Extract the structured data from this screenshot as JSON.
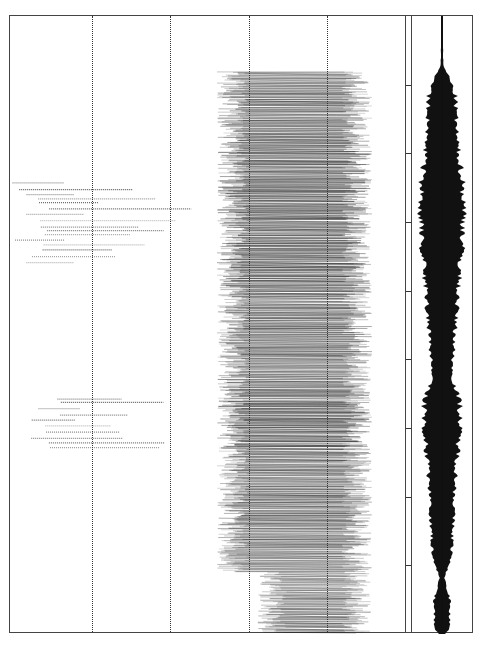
{
  "chart_data": {
    "type": "heatmap",
    "title": "",
    "subtitle": "",
    "xlabel": "",
    "ylabel": "",
    "grid": true,
    "gridlines_x_px": [
      91,
      169,
      248,
      326
    ],
    "panels": [
      {
        "name": "spectrogram",
        "bbox": [
          9,
          15,
          409,
          633
        ]
      },
      {
        "name": "waveform",
        "bbox": [
          411,
          15,
          473,
          633
        ]
      }
    ],
    "dense_band": {
      "x_start_frac": 0.53,
      "x_end_frac": 0.93,
      "y_start_frac": 0.09,
      "y_end_frac": 1.0
    },
    "sparse_harmonic_regions": [
      {
        "y_start_frac": 0.27,
        "y_end_frac": 0.4,
        "x_start_frac": 0.0,
        "x_end_frac": 0.45
      },
      {
        "y_start_frac": 0.62,
        "y_end_frac": 0.7,
        "x_start_frac": 0.03,
        "x_end_frac": 0.35
      }
    ],
    "waveform_envelope": [
      {
        "t": 0.0,
        "amp": 0.02
      },
      {
        "t": 0.08,
        "amp": 0.05
      },
      {
        "t": 0.1,
        "amp": 0.3
      },
      {
        "t": 0.13,
        "amp": 0.55
      },
      {
        "t": 0.2,
        "amp": 0.6
      },
      {
        "t": 0.27,
        "amp": 0.85
      },
      {
        "t": 0.33,
        "amp": 0.9
      },
      {
        "t": 0.4,
        "amp": 0.75
      },
      {
        "t": 0.5,
        "amp": 0.55
      },
      {
        "t": 0.58,
        "amp": 0.4
      },
      {
        "t": 0.63,
        "amp": 0.75
      },
      {
        "t": 0.68,
        "amp": 0.7
      },
      {
        "t": 0.75,
        "amp": 0.55
      },
      {
        "t": 0.82,
        "amp": 0.45
      },
      {
        "t": 0.87,
        "amp": 0.4
      },
      {
        "t": 0.91,
        "amp": 0.1
      },
      {
        "t": 0.95,
        "amp": 0.35
      },
      {
        "t": 0.99,
        "amp": 0.3
      },
      {
        "t": 1.0,
        "amp": 0.15
      }
    ],
    "divider_ticks": 8,
    "colors": {
      "background": "#ffffff",
      "ink": "#1a1a1a",
      "frame": "#444444"
    }
  }
}
